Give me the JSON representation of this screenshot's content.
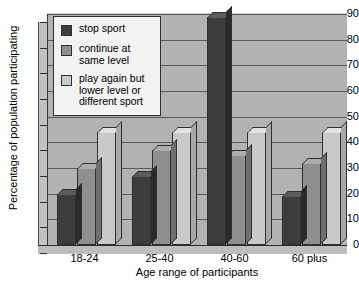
{
  "chart_data": {
    "type": "bar",
    "title": "",
    "xlabel": "Age range of participants",
    "ylabel": "Percentage of population participating",
    "categories": [
      "18-24",
      "25-40",
      "40-60",
      "60 plus"
    ],
    "ylim": [
      0,
      90
    ],
    "yticks": [
      0,
      10,
      20,
      30,
      40,
      50,
      60,
      70,
      80,
      90
    ],
    "grid": true,
    "legend_position": "top-left",
    "series": [
      {
        "name": "stop sport",
        "color": "#3d3d3d",
        "values": [
          20,
          27,
          89,
          19
        ]
      },
      {
        "name": "continue at same level",
        "color": "#8f8f8f",
        "values": [
          30,
          37,
          35,
          32
        ]
      },
      {
        "name": "play again but lower level or different sport",
        "color": "#c9c9c9",
        "values": [
          44,
          44,
          44,
          44
        ]
      }
    ]
  },
  "legend": {
    "items": [
      {
        "label": "stop sport"
      },
      {
        "label_line1": "continue at",
        "label_line2": "same level"
      },
      {
        "label_line1": "play again but",
        "label_line2": "lower level or",
        "label_line3": "different sport"
      }
    ]
  }
}
